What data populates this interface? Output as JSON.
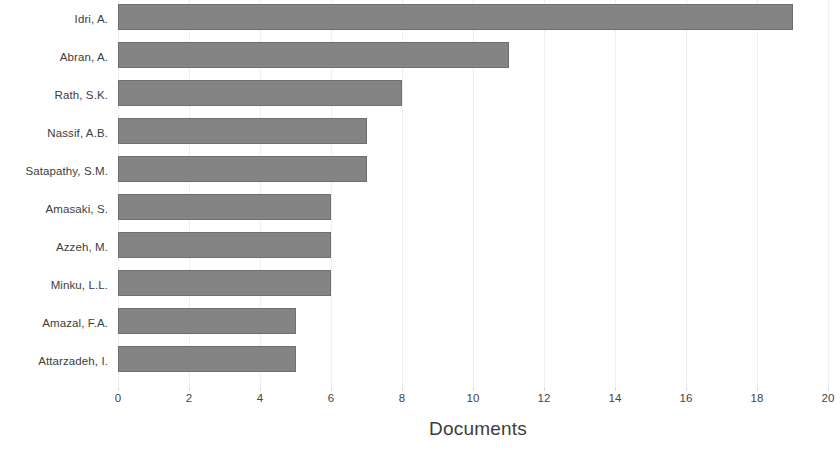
{
  "chart_data": {
    "type": "bar",
    "orientation": "horizontal",
    "title": "",
    "subtitle": "",
    "xlabel": "Documents",
    "ylabel": "",
    "categories": [
      "Idri, A.",
      "Abran, A.",
      "Rath, S.K.",
      "Nassif, A.B.",
      "Satapathy, S.M.",
      "Amasaki, S.",
      "Azzeh, M.",
      "Minku, L.L.",
      "Amazal, F.A.",
      "Attarzadeh, I."
    ],
    "values": [
      19,
      11,
      8,
      7,
      7,
      6,
      6,
      6,
      5,
      5
    ],
    "xlim": [
      0,
      20
    ],
    "xticks": [
      0,
      2,
      4,
      6,
      8,
      10,
      12,
      14,
      16,
      18,
      20
    ],
    "xtick_labels": [
      "0",
      "2",
      "4",
      "6",
      "8",
      "10",
      "12",
      "14",
      "16",
      "18",
      "20"
    ],
    "grid": true,
    "grid_axis": "x",
    "legend": false,
    "legend_position": "none",
    "bar_color": "#848484",
    "bar_border_color": "#6f6f6f",
    "grid_color": "#efefef",
    "text_color": "#3d3d3d",
    "background_color": "#ffffff"
  }
}
